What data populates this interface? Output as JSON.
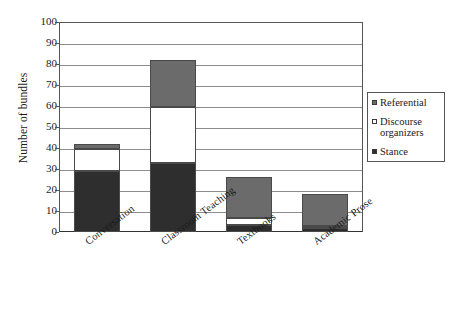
{
  "chart_data": {
    "type": "bar",
    "stacked": true,
    "title": "",
    "xlabel": "",
    "ylabel": "Number of bundles",
    "ylim": [
      0,
      100
    ],
    "ytick_step": 10,
    "yticks": [
      0,
      10,
      20,
      30,
      40,
      50,
      60,
      70,
      80,
      90,
      100
    ],
    "grid": true,
    "grid_axis": "y",
    "legend_position": "right",
    "categories": [
      "Conversation",
      "Classroom Teaching",
      "Textbooks",
      "Academic Prose"
    ],
    "series": [
      {
        "name": "Stance",
        "color": "#2e2e2e",
        "values": [
          29,
          33,
          3.5,
          2
        ]
      },
      {
        "name": "Discourse organizers",
        "color": "#ffffff",
        "values": [
          10.5,
          26.5,
          3,
          1
        ]
      },
      {
        "name": "Referential",
        "color": "#6b6b6b",
        "values": [
          2.5,
          22.5,
          19.5,
          15
        ]
      }
    ],
    "totals": [
      42,
      82,
      26,
      18
    ],
    "stack_order_bottom_to_top": [
      "Stance",
      "Discourse organizers",
      "Referential"
    ]
  },
  "legend": {
    "items": [
      {
        "label": "Referential",
        "swatch": "#6b6b6b"
      },
      {
        "label": "Discourse organizers",
        "swatch": "#ffffff"
      },
      {
        "label": "Stance",
        "swatch": "#2e2e2e"
      }
    ]
  },
  "axis": {
    "y_title": "Number of bundles",
    "y_labels": [
      "100",
      "90",
      "80",
      "70",
      "60",
      "50",
      "40",
      "30",
      "20",
      "10",
      "0"
    ],
    "x_labels": [
      "Conversation",
      "Classroom Teaching",
      "Textbooks",
      "Academic Prose"
    ]
  },
  "colors": {
    "stance": "#2e2e2e",
    "discourse_organizers": "#ffffff",
    "referential": "#6b6b6b",
    "gridline": "#8d8d8d",
    "frame": "#555555",
    "background": "#ffffff"
  }
}
